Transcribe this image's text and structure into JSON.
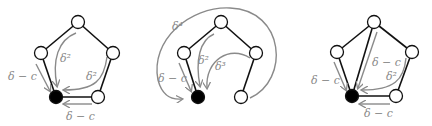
{
  "figure": {
    "panels": [
      {
        "id": "left",
        "labels": {
          "left_arrow": "δ − c",
          "inner_top": "δ²",
          "inner_right": "δ²",
          "bottom_arrow": "δ − c"
        }
      },
      {
        "id": "middle",
        "labels": {
          "outer_arc": "δ⁴",
          "left_arrow": "δ − c",
          "inner_top": "δ²",
          "inner_right": "δ³"
        }
      },
      {
        "id": "right",
        "labels": {
          "left_arrow": "δ − c",
          "diagonal": "δ − c",
          "inner_right": "δ²",
          "bottom_arrow": "δ − c"
        }
      }
    ],
    "colors": {
      "edge": "#111111",
      "arrow": "#8a8a8a",
      "node_fill": "#ffffff",
      "root_fill": "#000000"
    }
  }
}
